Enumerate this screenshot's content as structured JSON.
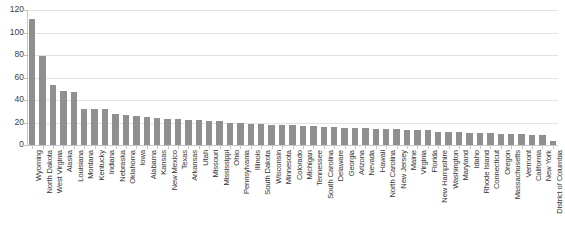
{
  "chart_data": {
    "type": "bar",
    "title": "",
    "xlabel": "",
    "ylabel": "",
    "ylim": [
      0,
      120
    ],
    "yticks": [
      0,
      20,
      40,
      60,
      80,
      100,
      120
    ],
    "grid": true,
    "legend": null,
    "bar_color": "#8f8f8f",
    "categories": [
      "Wyoming",
      "North Dakota",
      "West Virginia",
      "Alaska",
      "Louisiana",
      "Montana",
      "Kentucky",
      "Indiana",
      "Nebraska",
      "Oklahoma",
      "Iowa",
      "Alabama",
      "Kansas",
      "New Mexico",
      "Texas",
      "Arkansas",
      "Utah",
      "Missouri",
      "Mississippi",
      "Ohio",
      "Pennsylvania",
      "Illinois",
      "South Dakota",
      "Wisconsin",
      "Minnesota",
      "Colorado",
      "Michigan",
      "Tennessee",
      "South Carolina",
      "Delaware",
      "Georgia",
      "Arizona",
      "Nevada",
      "Hawaii",
      "North Carolina",
      "New Jersey",
      "Maine",
      "Virginia",
      "Florida",
      "New Hampshire",
      "Washington",
      "Maryland",
      "Idaho",
      "Rhode Island",
      "Connecticut",
      "Oregon",
      "Massachusetts",
      "Vermont",
      "California",
      "New York",
      "District of Columbia"
    ],
    "values": [
      112,
      79,
      53,
      48,
      47,
      32,
      32,
      32,
      28,
      27,
      26,
      25,
      24,
      23,
      23,
      22,
      22,
      21,
      21,
      20,
      20,
      19,
      19,
      18,
      18,
      18,
      17,
      17,
      16,
      16,
      15,
      15,
      15,
      14,
      14,
      14,
      13,
      13,
      13,
      12,
      12,
      12,
      11,
      11,
      11,
      10,
      10,
      10,
      9,
      9,
      4
    ]
  },
  "axes": {
    "y_tick_labels": [
      "0",
      "20",
      "40",
      "60",
      "80",
      "100",
      "120"
    ]
  },
  "title_remnant": "."
}
